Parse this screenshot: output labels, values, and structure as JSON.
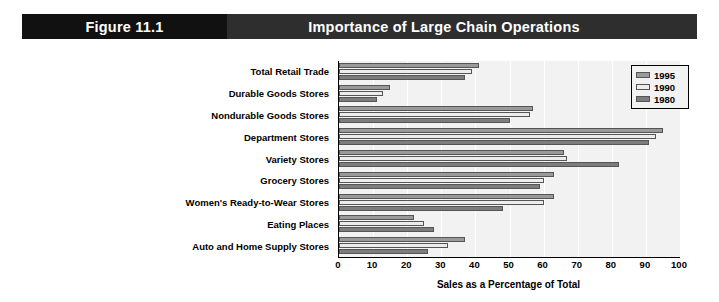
{
  "header": {
    "figure_number": "Figure 11.1",
    "title": "Importance of Large Chain Operations"
  },
  "chart_data": {
    "type": "bar",
    "orientation": "horizontal",
    "title": "Importance of Large Chain Operations",
    "xlabel": "Sales as a Percentage of Total",
    "ylabel": "",
    "xlim": [
      0,
      100
    ],
    "xticks": [
      0,
      10,
      20,
      30,
      40,
      50,
      60,
      70,
      80,
      90,
      100
    ],
    "grid": true,
    "legend_position": "top-right",
    "categories": [
      "Total Retail Trade",
      "Durable Goods Stores",
      "Nondurable Goods Stores",
      "Department Stores",
      "Variety Stores",
      "Grocery Stores",
      "Women's Ready-to-Wear Stores",
      "Eating Places",
      "Auto and Home Supply Stores"
    ],
    "series": [
      {
        "name": "1995",
        "color": "#9a9a9a",
        "values": [
          41,
          15,
          57,
          95,
          66,
          63,
          63,
          22,
          37
        ]
      },
      {
        "name": "1990",
        "color": "#ededed",
        "values": [
          39,
          13,
          56,
          93,
          67,
          60,
          60,
          25,
          32
        ]
      },
      {
        "name": "1980",
        "color": "#7d7d7d",
        "values": [
          37,
          11,
          50,
          91,
          82,
          59,
          48,
          28,
          26
        ]
      }
    ]
  },
  "legend": {
    "items": [
      {
        "label": "1995",
        "color": "#9a9a9a"
      },
      {
        "label": "1990",
        "color": "#ededed"
      },
      {
        "label": "1980",
        "color": "#7d7d7d"
      }
    ]
  }
}
